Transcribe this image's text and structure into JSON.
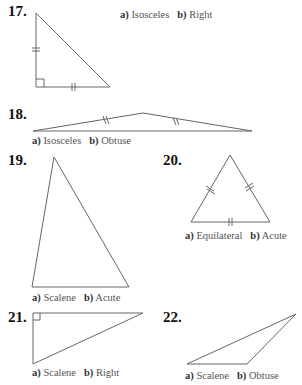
{
  "problems": [
    {
      "number": "17.",
      "a_label": "a)",
      "a_value": "Isosceles",
      "b_label": "b)",
      "b_value": "Right"
    },
    {
      "number": "18.",
      "a_label": "a)",
      "a_value": "Isosceles",
      "b_label": "b)",
      "b_value": "Obtuse"
    },
    {
      "number": "19.",
      "a_label": "a)",
      "a_value": "Scalene",
      "b_label": "b)",
      "b_value": "Acute"
    },
    {
      "number": "20.",
      "a_label": "a)",
      "a_value": "Equilateral",
      "b_label": "b)",
      "b_value": "Acute"
    },
    {
      "number": "21.",
      "a_label": "a)",
      "a_value": "Scalene",
      "b_label": "b)",
      "b_value": "Right"
    },
    {
      "number": "22.",
      "a_label": "a)",
      "a_value": "Scalene",
      "b_label": "b)",
      "b_value": "Obtuse"
    }
  ]
}
